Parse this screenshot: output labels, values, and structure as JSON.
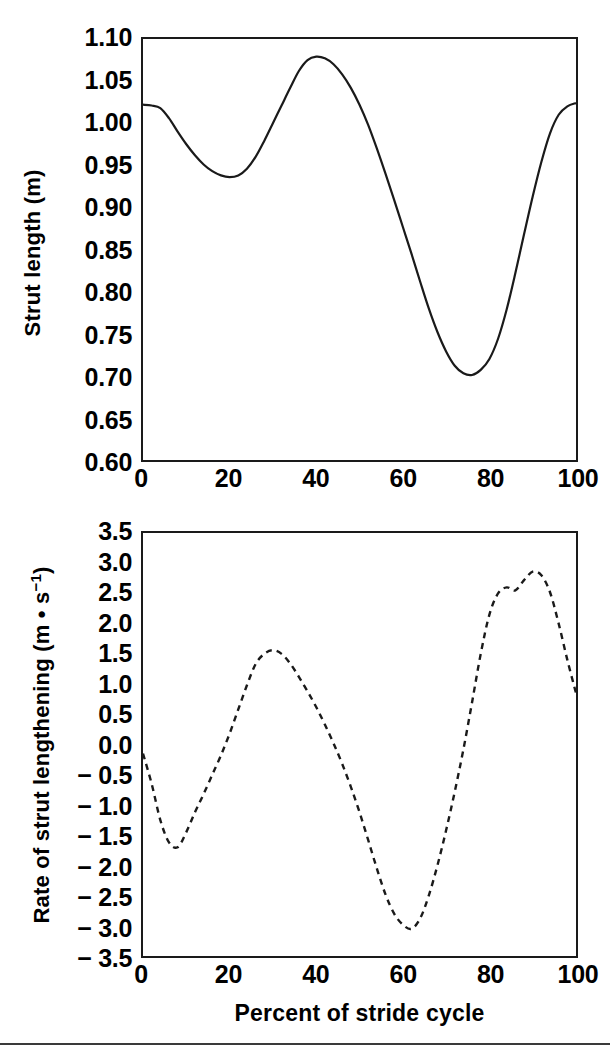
{
  "figure": {
    "background": "#ffffff",
    "line_color": "#1a1a1a",
    "bottom_rule": true
  },
  "xtitle": "Percent of stride cycle",
  "panels": {
    "top": {
      "ytitle": "Strut length (m)",
      "yticks": [
        "1.10",
        "1.05",
        "1.00",
        "0.95",
        "0.90",
        "0.85",
        "0.80",
        "0.75",
        "0.70",
        "0.65",
        "0.60"
      ],
      "xticks": [
        "0",
        "20",
        "40",
        "60",
        "80",
        "100"
      ]
    },
    "bottom": {
      "ytitle_main": "Rate of strut lengthening (m • s",
      "ytitle_sup": "−1",
      "ytitle_tail": ")",
      "yticks": [
        "3.5",
        "3.0",
        "2.5",
        "2.0",
        "1.5",
        "1.0",
        "0.5",
        "0.0",
        "− 0.5",
        "− 1.0",
        "− 1.5",
        "− 2.0",
        "− 2.5",
        "− 3.0",
        "− 3.5"
      ],
      "xticks": [
        "0",
        "20",
        "40",
        "60",
        "80",
        "100"
      ]
    }
  },
  "chart_data": [
    {
      "id": "strut-length",
      "type": "line",
      "title": "",
      "xlabel": "Percent of stride cycle",
      "ylabel": "Strut length (m)",
      "xlim": [
        0,
        100
      ],
      "ylim": [
        0.6,
        1.1
      ],
      "xticks": [
        0,
        20,
        40,
        60,
        80,
        100
      ],
      "yticks": [
        0.6,
        0.65,
        0.7,
        0.75,
        0.8,
        0.85,
        0.9,
        0.95,
        1.0,
        1.05,
        1.1
      ],
      "grid": false,
      "legend": "none",
      "linestyle": "solid",
      "x": [
        0,
        2,
        4,
        6,
        8,
        10,
        12,
        14,
        16,
        18,
        20,
        22,
        24,
        26,
        28,
        30,
        32,
        34,
        36,
        38,
        40,
        42,
        44,
        46,
        48,
        50,
        52,
        54,
        56,
        58,
        60,
        62,
        64,
        66,
        68,
        70,
        72,
        74,
        76,
        78,
        80,
        82,
        84,
        86,
        88,
        90,
        92,
        94,
        96,
        98,
        100
      ],
      "y": [
        1.022,
        1.021,
        1.018,
        1.006,
        0.99,
        0.975,
        0.962,
        0.951,
        0.943,
        0.938,
        0.936,
        0.938,
        0.946,
        0.96,
        0.979,
        1.0,
        1.021,
        1.042,
        1.062,
        1.075,
        1.079,
        1.077,
        1.07,
        1.058,
        1.042,
        1.022,
        0.998,
        0.97,
        0.94,
        0.909,
        0.877,
        0.845,
        0.812,
        0.78,
        0.752,
        0.729,
        0.712,
        0.703,
        0.701,
        0.707,
        0.72,
        0.744,
        0.779,
        0.822,
        0.868,
        0.913,
        0.954,
        0.988,
        1.01,
        1.02,
        1.024
      ]
    },
    {
      "id": "rate-of-strut-lengthening",
      "type": "line",
      "title": "",
      "xlabel": "Percent of stride cycle",
      "ylabel": "Rate of strut lengthening (m • s−1)",
      "xlim": [
        0,
        100
      ],
      "ylim": [
        -3.5,
        3.5
      ],
      "xticks": [
        0,
        20,
        40,
        60,
        80,
        100
      ],
      "yticks": [
        -3.5,
        -3.0,
        -2.5,
        -2.0,
        -1.5,
        -1.0,
        -0.5,
        0.0,
        0.5,
        1.0,
        1.5,
        2.0,
        2.5,
        3.0,
        3.5
      ],
      "grid": false,
      "legend": "none",
      "linestyle": "dashed",
      "x": [
        0,
        2,
        4,
        6,
        8,
        10,
        12,
        14,
        16,
        18,
        20,
        22,
        24,
        26,
        28,
        30,
        32,
        34,
        36,
        38,
        40,
        42,
        44,
        46,
        48,
        50,
        52,
        54,
        56,
        58,
        60,
        62,
        64,
        66,
        68,
        70,
        72,
        74,
        76,
        78,
        80,
        82,
        84,
        86,
        88,
        90,
        92,
        94,
        96,
        98,
        100
      ],
      "y": [
        -0.15,
        -0.65,
        -1.25,
        -1.62,
        -1.7,
        -1.45,
        -1.12,
        -0.82,
        -0.5,
        -0.18,
        0.18,
        0.58,
        0.98,
        1.33,
        1.5,
        1.56,
        1.5,
        1.34,
        1.12,
        0.88,
        0.62,
        0.33,
        0.02,
        -0.32,
        -0.7,
        -1.12,
        -1.58,
        -2.05,
        -2.48,
        -2.8,
        -2.98,
        -3.05,
        -2.88,
        -2.5,
        -2.0,
        -1.42,
        -0.78,
        -0.08,
        0.7,
        1.5,
        2.15,
        2.5,
        2.6,
        2.55,
        2.72,
        2.86,
        2.8,
        2.52,
        2.0,
        1.4,
        0.85
      ],
      "note": "values estimated from plotted dashed curve"
    }
  ]
}
